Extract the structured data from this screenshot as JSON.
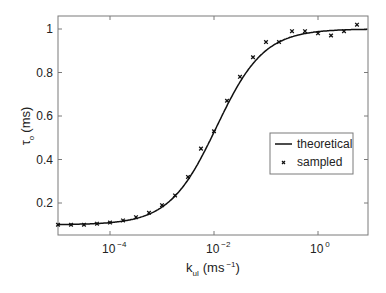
{
  "chart_data": {
    "type": "line",
    "title": "",
    "xlabel": "k_ul (ms^-1)",
    "ylabel": "τ_o (ms)",
    "xscale": "log",
    "xlim": [
      9e-06,
      10
    ],
    "ylim": [
      0.05,
      1.05
    ],
    "x_ticks": [
      "10^-4",
      "10^-2",
      "10^0"
    ],
    "y_ticks": [
      "0.2",
      "0.4",
      "0.6",
      "0.8",
      "1"
    ],
    "grid": false,
    "legend_position": "center-right",
    "series": [
      {
        "name": "theoretical",
        "style": "solid line",
        "x": [
          1e-05,
          0.0001,
          0.0003,
          0.001,
          0.003,
          0.01,
          0.03,
          0.1,
          0.3,
          1,
          10
        ],
        "y": [
          0.1,
          0.11,
          0.14,
          0.24,
          0.42,
          0.55,
          0.75,
          0.92,
          0.98,
          1.0,
          1.0
        ]
      },
      {
        "name": "sampled",
        "style": "x markers",
        "x": [
          1e-05,
          1.78e-05,
          3.16e-05,
          5.62e-05,
          0.0001,
          0.000178,
          0.000316,
          0.000562,
          0.001,
          0.00178,
          0.00316,
          0.00562,
          0.01,
          0.0178,
          0.0316,
          0.0562,
          0.1,
          0.178,
          0.316,
          0.562,
          1,
          1.78,
          3.16,
          5.62,
          10
        ],
        "y": [
          0.1,
          0.1,
          0.1,
          0.105,
          0.11,
          0.12,
          0.135,
          0.155,
          0.19,
          0.235,
          0.32,
          0.45,
          0.53,
          0.67,
          0.78,
          0.87,
          0.94,
          0.94,
          0.99,
          0.99,
          0.98,
          0.97,
          0.99,
          1.02,
          1.03
        ]
      }
    ]
  },
  "axes": {
    "ylabel_main": "τ",
    "ylabel_sub": "o",
    "ylabel_unit": "(ms)",
    "xlabel_main": "k",
    "xlabel_sub": "ul",
    "xlabel_unit_pre": "(ms",
    "xlabel_unit_sup": "−1",
    "xlabel_unit_post": ")",
    "xticks": [
      {
        "base": "10",
        "exp": "−4"
      },
      {
        "base": "10",
        "exp": "−2"
      },
      {
        "base": "10",
        "exp": "0"
      }
    ],
    "yticks": [
      "0.2",
      "0.4",
      "0.6",
      "0.8",
      "1"
    ]
  },
  "legend": {
    "theoretical": "theoretical",
    "sampled": "sampled"
  }
}
